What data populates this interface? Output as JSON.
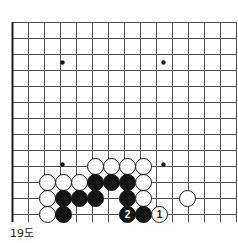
{
  "caption": "19도",
  "board": {
    "name": "go-board-corner-diagram",
    "cell_size": 16,
    "origin_x": 12,
    "origin_y": 22,
    "cols": 14,
    "rows": 13,
    "edges": {
      "left_edge": true,
      "bottom_edge": true,
      "top_edge": false,
      "right_edge": false
    },
    "line_color": "#4d4d4d",
    "edge_color": "#1a1a1a",
    "star_points": [
      {
        "x": 62,
        "y": 62
      },
      {
        "x": 163,
        "y": 62
      },
      {
        "x": 62,
        "y": 164
      },
      {
        "x": 163,
        "y": 164
      }
    ]
  },
  "stones": [
    {
      "color": "white",
      "label": "",
      "x": 95,
      "y": 166
    },
    {
      "color": "white",
      "label": "",
      "x": 111,
      "y": 166
    },
    {
      "color": "white",
      "label": "",
      "x": 127,
      "y": 166
    },
    {
      "color": "white",
      "label": "",
      "x": 143,
      "y": 166
    },
    {
      "color": "white",
      "label": "",
      "x": 47,
      "y": 182
    },
    {
      "color": "white",
      "label": "",
      "x": 63,
      "y": 182
    },
    {
      "color": "white",
      "label": "",
      "x": 79,
      "y": 182
    },
    {
      "color": "black",
      "label": "",
      "x": 95,
      "y": 182
    },
    {
      "color": "black",
      "label": "",
      "x": 111,
      "y": 182
    },
    {
      "color": "black",
      "label": "",
      "x": 127,
      "y": 182
    },
    {
      "color": "white",
      "label": "",
      "x": 143,
      "y": 182
    },
    {
      "color": "white",
      "label": "",
      "x": 47,
      "y": 198
    },
    {
      "color": "black",
      "label": "",
      "x": 63,
      "y": 198
    },
    {
      "color": "black",
      "label": "",
      "x": 79,
      "y": 198
    },
    {
      "color": "black",
      "label": "",
      "x": 95,
      "y": 198
    },
    {
      "color": "black",
      "label": "",
      "x": 127,
      "y": 198
    },
    {
      "color": "white",
      "label": "",
      "x": 143,
      "y": 198
    },
    {
      "color": "white",
      "label": "",
      "x": 187,
      "y": 198
    },
    {
      "color": "white",
      "label": "",
      "x": 47,
      "y": 214
    },
    {
      "color": "black",
      "label": "",
      "x": 63,
      "y": 214
    },
    {
      "color": "black",
      "label": "2",
      "x": 127,
      "y": 214
    },
    {
      "color": "black",
      "label": "",
      "x": 143,
      "y": 214
    },
    {
      "color": "white",
      "label": "1",
      "x": 159,
      "y": 214
    }
  ],
  "colors": {
    "black_stone": "#151515",
    "white_stone": "#ffffff",
    "stone_outline": "#1a1a1a",
    "grid": "#4d4d4d",
    "border": "#1a1a1a",
    "background": "#ffffff",
    "text": "#1a1a1a"
  }
}
